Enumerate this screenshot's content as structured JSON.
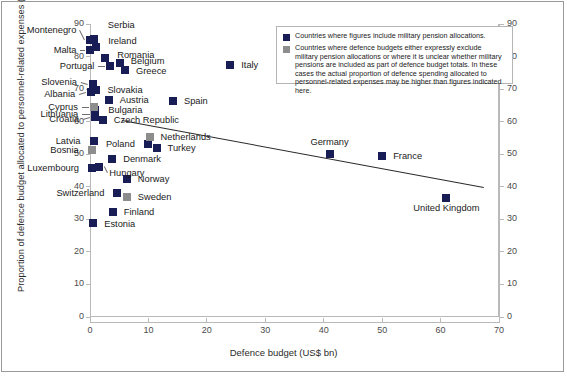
{
  "chart_data": {
    "type": "scatter",
    "title": "",
    "xlabel": "Defence budget (US$ bn)",
    "ylabel": "Proportion of defence budget allocated to personnel-related expenses (%)",
    "xlim": [
      0,
      70
    ],
    "ylim": [
      0,
      90
    ],
    "xticks": [
      0,
      10,
      20,
      30,
      40,
      50,
      60,
      70
    ],
    "yticks": [
      0,
      10,
      20,
      30,
      40,
      50,
      60,
      70,
      80,
      90
    ],
    "grid": false,
    "right_axis": true,
    "legend_position": "top-right",
    "series": [
      {
        "name": "include-military-pensions",
        "color": "#181d56",
        "points": [
          {
            "label": "Montenegro",
            "x": 0.06,
            "y": 85.0
          },
          {
            "label": "Serbia",
            "x": 0.65,
            "y": 85.5
          },
          {
            "label": "Malta",
            "x": 0.07,
            "y": 82.0
          },
          {
            "label": "Ireland",
            "x": 1.05,
            "y": 82.8
          },
          {
            "label": "Romania",
            "x": 2.6,
            "y": 79.6
          },
          {
            "label": "Portugal",
            "x": 3.5,
            "y": 77.2
          },
          {
            "label": "Belgium",
            "x": 5.1,
            "y": 78.0
          },
          {
            "label": "Greece",
            "x": 6.0,
            "y": 75.8
          },
          {
            "label": "Slovenia",
            "x": 0.5,
            "y": 71.5
          },
          {
            "label": "Slovakia",
            "x": 1.1,
            "y": 69.6
          },
          {
            "label": "Albania",
            "x": 0.2,
            "y": 69.0
          },
          {
            "label": "Austria",
            "x": 3.2,
            "y": 66.8
          },
          {
            "label": "Italy",
            "x": 24.0,
            "y": 77.4
          },
          {
            "label": "Spain",
            "x": 14.2,
            "y": 66.4
          },
          {
            "label": "Lithuania",
            "x": 0.9,
            "y": 62.4
          },
          {
            "label": "Croatia",
            "x": 0.9,
            "y": 61.4
          },
          {
            "label": "Czech Republic",
            "x": 2.2,
            "y": 60.4
          },
          {
            "label": "Latvia",
            "x": 0.6,
            "y": 54.0
          },
          {
            "label": "Poland",
            "x": 9.9,
            "y": 53.0
          },
          {
            "label": "Turkey",
            "x": 11.4,
            "y": 52.0
          },
          {
            "label": "Germany",
            "x": 41.0,
            "y": 50.0
          },
          {
            "label": "France",
            "x": 50.0,
            "y": 49.6
          },
          {
            "label": "Denmark",
            "x": 3.8,
            "y": 48.5
          },
          {
            "label": "Hungary",
            "x": 1.6,
            "y": 46.0
          },
          {
            "label": "Luxembourg",
            "x": 0.35,
            "y": 45.8
          },
          {
            "label": "Norway",
            "x": 6.3,
            "y": 42.4
          },
          {
            "label": "Switzerland",
            "x": 4.7,
            "y": 38.0
          },
          {
            "label": "Finland",
            "x": 3.9,
            "y": 32.4
          },
          {
            "label": "United Kingdom",
            "x": 61.0,
            "y": 36.4
          },
          {
            "label": "Estonia",
            "x": 0.55,
            "y": 28.8
          },
          {
            "label": "Bulgaria",
            "x": 0.9,
            "y": 63.6
          }
        ]
      },
      {
        "name": "exclude-or-unclear-military-pensions",
        "color": "#8d8d8d",
        "points": [
          {
            "label": "Cyprus",
            "x": 0.65,
            "y": 64.6
          },
          {
            "label": "Netherlands",
            "x": 10.2,
            "y": 55.4
          },
          {
            "label": "Bosnia",
            "x": 0.3,
            "y": 51.4
          },
          {
            "label": "Sweden",
            "x": 6.3,
            "y": 36.8
          }
        ]
      }
    ],
    "trendline": {
      "x0": 5.5,
      "y0": 60.4,
      "x1": 67.5,
      "y1": 39.8
    }
  },
  "legend": {
    "entries": [
      {
        "swatch": "dark",
        "text": "Countries where figures include military pension allocations."
      },
      {
        "swatch": "grey",
        "text": "Countries where defence budgets either expressly exclude military pension allocations or where it is unclear whether military pensions are included as part of defence budget totals. In these cases the actual proportion of defence spending allocated to personnel-related expenses may be higher than figures indicated here."
      }
    ]
  },
  "caption": ""
}
